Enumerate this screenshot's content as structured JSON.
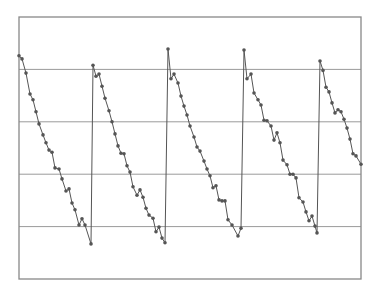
{
  "chart_data": {
    "type": "line",
    "title": "",
    "xlabel": "",
    "ylabel": "",
    "grid": true,
    "legend": null,
    "xlim": [
      0,
      342
    ],
    "ylim": [
      0,
      5
    ],
    "ytick_gridlines": [
      1,
      2,
      3,
      4
    ],
    "colors": {
      "line": "#555555",
      "marker": "#555555",
      "frame": "#888888",
      "grid": "#9a9a9a",
      "background": "#ffffff"
    },
    "series": [
      {
        "name": "series-1",
        "x": [
          0,
          3,
          7,
          11,
          14,
          17,
          20,
          24,
          27,
          30,
          33,
          36,
          40,
          43,
          47,
          50,
          53,
          56,
          60,
          63,
          66,
          72,
          74,
          77,
          80,
          83,
          86,
          90,
          93,
          96,
          99,
          102,
          105,
          108,
          111,
          114,
          118,
          121,
          124,
          127,
          130,
          134,
          137,
          140,
          143,
          146,
          149,
          152,
          155,
          159,
          162,
          165,
          168,
          171,
          175,
          178,
          181,
          185,
          188,
          191,
          194,
          197,
          200,
          203,
          206,
          209,
          213,
          219,
          222,
          225,
          228,
          232,
          235,
          239,
          242,
          245,
          248,
          252,
          255,
          258,
          261,
          264,
          268,
          271,
          274,
          277,
          280,
          284,
          287,
          290,
          293,
          296,
          298,
          301,
          304,
          307,
          310,
          313,
          316,
          319,
          322,
          325,
          328,
          331,
          334,
          337,
          342
        ],
        "y": [
          4.26,
          4.2,
          3.93,
          3.53,
          3.42,
          3.19,
          2.96,
          2.75,
          2.6,
          2.46,
          2.42,
          2.12,
          2.1,
          1.91,
          1.68,
          1.72,
          1.45,
          1.32,
          1.03,
          1.15,
          1.03,
          0.67,
          4.08,
          3.87,
          3.91,
          3.68,
          3.45,
          3.21,
          3.0,
          2.77,
          2.54,
          2.4,
          2.39,
          2.16,
          2.04,
          1.76,
          1.6,
          1.7,
          1.56,
          1.35,
          1.22,
          1.16,
          0.9,
          0.99,
          0.78,
          0.69,
          4.39,
          3.82,
          3.91,
          3.74,
          3.49,
          3.3,
          3.13,
          2.92,
          2.71,
          2.52,
          2.44,
          2.25,
          2.1,
          1.97,
          1.74,
          1.78,
          1.51,
          1.49,
          1.49,
          1.13,
          1.03,
          0.82,
          0.97,
          4.37,
          3.82,
          3.91,
          3.55,
          3.42,
          3.32,
          3.03,
          3.02,
          2.92,
          2.65,
          2.79,
          2.6,
          2.27,
          2.18,
          2.0,
          2.0,
          1.93,
          1.55,
          1.47,
          1.28,
          1.11,
          1.2,
          1.01,
          0.88,
          4.16,
          3.98,
          3.66,
          3.57,
          3.36,
          3.17,
          3.23,
          3.19,
          3.05,
          2.88,
          2.67,
          2.39,
          2.35,
          2.19
        ]
      }
    ]
  }
}
